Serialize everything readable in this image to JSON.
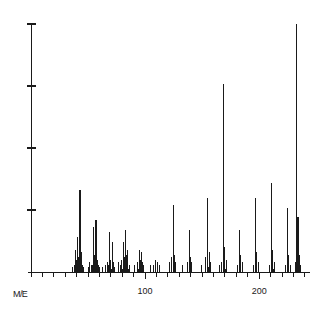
{
  "chart_data": {
    "type": "bar",
    "title": "",
    "subtitle": "",
    "xlabel": "M/E",
    "ylabel": "",
    "xlim": [
      0,
      250
    ],
    "ylim": [
      0,
      100
    ],
    "grid": false,
    "legend": null,
    "x_tick_labels": [
      {
        "value": 100,
        "label": "100"
      },
      {
        "value": 200,
        "label": "200"
      }
    ],
    "x_minor_tick_interval": 10,
    "y_tick_values": [
      25,
      50,
      75,
      100
    ],
    "y_tick_labels": [
      "",
      "",
      "",
      ""
    ],
    "line_color": "#1a1a1a",
    "background_color": "#ffffff",
    "peaks": [
      {
        "mz": 36,
        "intensity": 2
      },
      {
        "mz": 38,
        "intensity": 3
      },
      {
        "mz": 39,
        "intensity": 9
      },
      {
        "mz": 40,
        "intensity": 5
      },
      {
        "mz": 41,
        "intensity": 14
      },
      {
        "mz": 42,
        "intensity": 6
      },
      {
        "mz": 43,
        "intensity": 33
      },
      {
        "mz": 44,
        "intensity": 8
      },
      {
        "mz": 45,
        "intensity": 3
      },
      {
        "mz": 46,
        "intensity": 2
      },
      {
        "mz": 50,
        "intensity": 2
      },
      {
        "mz": 51,
        "intensity": 4
      },
      {
        "mz": 53,
        "intensity": 3
      },
      {
        "mz": 54,
        "intensity": 3
      },
      {
        "mz": 55,
        "intensity": 18
      },
      {
        "mz": 56,
        "intensity": 7
      },
      {
        "mz": 57,
        "intensity": 21
      },
      {
        "mz": 58,
        "intensity": 5
      },
      {
        "mz": 59,
        "intensity": 3
      },
      {
        "mz": 60,
        "intensity": 2
      },
      {
        "mz": 63,
        "intensity": 2
      },
      {
        "mz": 65,
        "intensity": 3
      },
      {
        "mz": 67,
        "intensity": 4
      },
      {
        "mz": 68,
        "intensity": 3
      },
      {
        "mz": 69,
        "intensity": 16
      },
      {
        "mz": 70,
        "intensity": 5
      },
      {
        "mz": 71,
        "intensity": 12
      },
      {
        "mz": 72,
        "intensity": 4
      },
      {
        "mz": 73,
        "intensity": 2
      },
      {
        "mz": 77,
        "intensity": 4
      },
      {
        "mz": 78,
        "intensity": 3
      },
      {
        "mz": 79,
        "intensity": 5
      },
      {
        "mz": 81,
        "intensity": 12
      },
      {
        "mz": 82,
        "intensity": 6
      },
      {
        "mz": 83,
        "intensity": 17
      },
      {
        "mz": 84,
        "intensity": 7
      },
      {
        "mz": 85,
        "intensity": 9
      },
      {
        "mz": 86,
        "intensity": 3
      },
      {
        "mz": 91,
        "intensity": 3
      },
      {
        "mz": 93,
        "intensity": 4
      },
      {
        "mz": 95,
        "intensity": 9
      },
      {
        "mz": 96,
        "intensity": 5
      },
      {
        "mz": 97,
        "intensity": 8
      },
      {
        "mz": 98,
        "intensity": 4
      },
      {
        "mz": 99,
        "intensity": 3
      },
      {
        "mz": 105,
        "intensity": 3
      },
      {
        "mz": 107,
        "intensity": 3
      },
      {
        "mz": 109,
        "intensity": 5
      },
      {
        "mz": 111,
        "intensity": 4
      },
      {
        "mz": 113,
        "intensity": 3
      },
      {
        "mz": 121,
        "intensity": 4
      },
      {
        "mz": 123,
        "intensity": 6
      },
      {
        "mz": 125,
        "intensity": 27
      },
      {
        "mz": 126,
        "intensity": 7
      },
      {
        "mz": 127,
        "intensity": 4
      },
      {
        "mz": 133,
        "intensity": 3
      },
      {
        "mz": 137,
        "intensity": 4
      },
      {
        "mz": 139,
        "intensity": 17
      },
      {
        "mz": 140,
        "intensity": 6
      },
      {
        "mz": 141,
        "intensity": 4
      },
      {
        "mz": 149,
        "intensity": 3
      },
      {
        "mz": 153,
        "intensity": 6
      },
      {
        "mz": 155,
        "intensity": 30
      },
      {
        "mz": 156,
        "intensity": 8
      },
      {
        "mz": 157,
        "intensity": 4
      },
      {
        "mz": 165,
        "intensity": 3
      },
      {
        "mz": 167,
        "intensity": 4
      },
      {
        "mz": 169,
        "intensity": 76
      },
      {
        "mz": 170,
        "intensity": 10
      },
      {
        "mz": 171,
        "intensity": 5
      },
      {
        "mz": 181,
        "intensity": 3
      },
      {
        "mz": 183,
        "intensity": 17
      },
      {
        "mz": 184,
        "intensity": 7
      },
      {
        "mz": 185,
        "intensity": 4
      },
      {
        "mz": 195,
        "intensity": 3
      },
      {
        "mz": 197,
        "intensity": 30
      },
      {
        "mz": 198,
        "intensity": 8
      },
      {
        "mz": 199,
        "intensity": 4
      },
      {
        "mz": 209,
        "intensity": 3
      },
      {
        "mz": 211,
        "intensity": 36
      },
      {
        "mz": 212,
        "intensity": 9
      },
      {
        "mz": 213,
        "intensity": 4
      },
      {
        "mz": 223,
        "intensity": 3
      },
      {
        "mz": 225,
        "intensity": 26
      },
      {
        "mz": 226,
        "intensity": 7
      },
      {
        "mz": 227,
        "intensity": 3
      },
      {
        "mz": 232,
        "intensity": 4
      },
      {
        "mz": 233,
        "intensity": 100
      },
      {
        "mz": 234,
        "intensity": 22
      },
      {
        "mz": 235,
        "intensity": 7
      },
      {
        "mz": 236,
        "intensity": 3
      }
    ]
  }
}
